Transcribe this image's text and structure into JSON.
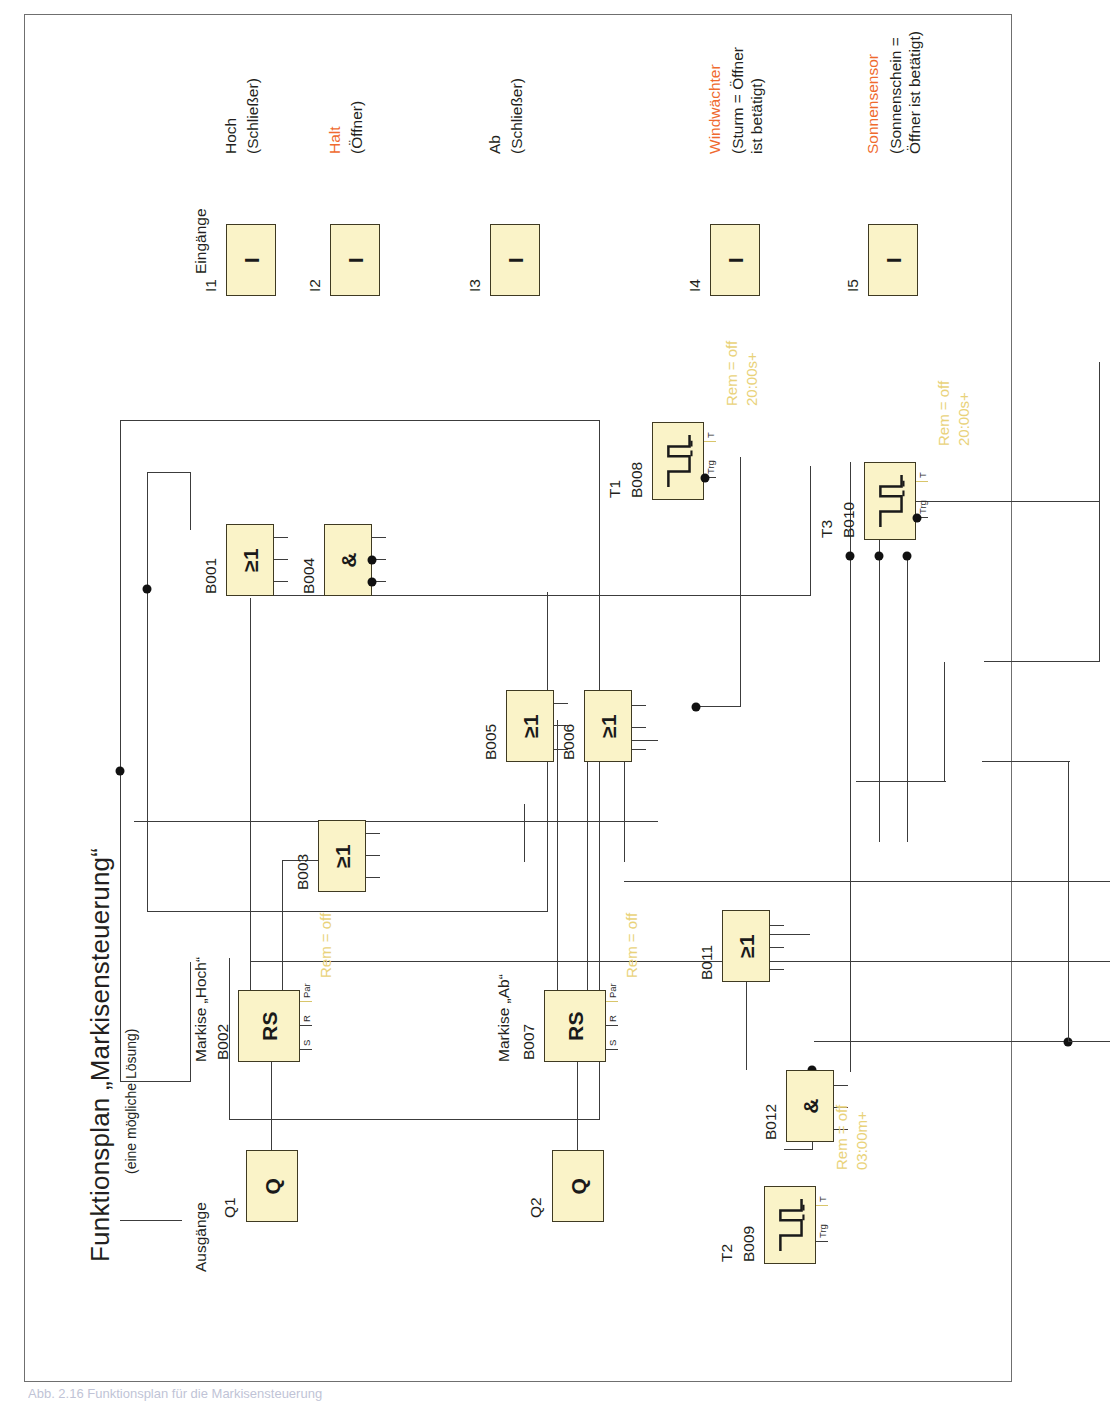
{
  "document": {
    "title": "Funktionsplan „Markisensteuerung“",
    "subtitle": "(eine mögliche Lösung)",
    "caption": "Abb. 2.16  Funktionsplan für die Markisensteuerung",
    "colors": {
      "block_fill": "#faf3c8",
      "block_stroke": "#3f3a22",
      "wire": "#3c3c3c",
      "param_text": "#e9d27a",
      "accent_orange": "#ef6a2e",
      "frame": "#6f6f6f"
    }
  },
  "sections": {
    "outputs_label": "Ausgänge",
    "inputs_label": "Eingänge"
  },
  "group_labels": {
    "markise_hoch": "Markise „Hoch“",
    "markise_ab": "Markise „Ab“"
  },
  "outputs": [
    {
      "id": "Q1",
      "glyph": "Q"
    },
    {
      "id": "Q2",
      "glyph": "Q"
    }
  ],
  "inputs": [
    {
      "id": "I1",
      "glyph": "I",
      "name": "Hoch",
      "name_color": "black",
      "detail": "(Schließer)"
    },
    {
      "id": "I2",
      "glyph": "I",
      "name": "Halt",
      "name_color": "orange",
      "detail": "(Öffner)"
    },
    {
      "id": "I3",
      "glyph": "I",
      "name": "Ab",
      "name_color": "black",
      "detail": "(Schließer)"
    },
    {
      "id": "I4",
      "glyph": "I",
      "name": "Windwächter",
      "name_color": "orange",
      "detail": "(Sturm = Öffner\nist betätigt)"
    },
    {
      "id": "I5",
      "glyph": "I",
      "name": "Sonnensensor",
      "name_color": "orange",
      "detail": "(Sonnenschein =\nÖffner ist betätigt)"
    }
  ],
  "blocks": [
    {
      "id": "B001",
      "type": "or",
      "glyph": "≥1"
    },
    {
      "id": "B002",
      "type": "rs",
      "glyph": "RS",
      "pins": [
        "S",
        "R",
        "Par"
      ],
      "param": "Rem = off"
    },
    {
      "id": "B003",
      "type": "or",
      "glyph": "≥1"
    },
    {
      "id": "B004",
      "type": "and",
      "glyph": "&"
    },
    {
      "id": "B005",
      "type": "or",
      "glyph": "≥1"
    },
    {
      "id": "B006",
      "type": "or",
      "glyph": "≥1"
    },
    {
      "id": "B007",
      "type": "rs",
      "glyph": "RS",
      "pins": [
        "S",
        "R",
        "Par"
      ],
      "param": "Rem = off"
    },
    {
      "id": "B008",
      "type": "timer",
      "tag": "T1",
      "pins": [
        "Trg",
        "T"
      ],
      "param_line1": "Rem = off",
      "param_line2": "20:00s+"
    },
    {
      "id": "B009",
      "type": "timer",
      "tag": "T2",
      "pins": [
        "Trg",
        "T"
      ],
      "param_line1": "Rem = off",
      "param_line2": "03:00m+"
    },
    {
      "id": "B010",
      "type": "timer",
      "tag": "T3",
      "pins": [
        "Trg",
        "T"
      ],
      "param_line1": "Rem = off",
      "param_line2": "20:00s+"
    },
    {
      "id": "B011",
      "type": "or",
      "glyph": "≥1"
    },
    {
      "id": "B012",
      "type": "and",
      "glyph": "&"
    }
  ]
}
